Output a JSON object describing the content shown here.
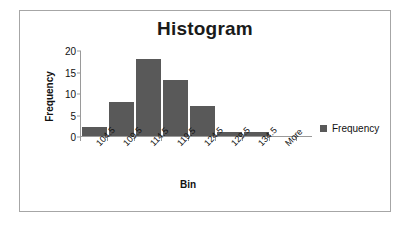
{
  "chart_data": {
    "type": "bar",
    "title": "Histogram",
    "xlabel": "Bin",
    "ylabel": "Frequency",
    "categories": [
      "104.5",
      "109.5",
      "114.5",
      "119.5",
      "124.5",
      "129.5",
      "134.5",
      "More"
    ],
    "values": [
      2,
      8,
      18,
      13,
      7,
      1,
      1,
      0
    ],
    "series": [
      {
        "name": "Frequency",
        "values": [
          2,
          8,
          18,
          13,
          7,
          1,
          1,
          0
        ]
      }
    ],
    "ylim": [
      0,
      20
    ],
    "yticks": [
      0,
      5,
      10,
      15,
      20
    ],
    "grid": false,
    "legend": {
      "position": "right",
      "entries": [
        "Frequency"
      ]
    },
    "bar_color": "#595959",
    "axis_color": "#9a9a9a",
    "background": "#ffffff",
    "border_color": "#a6a6a6"
  }
}
